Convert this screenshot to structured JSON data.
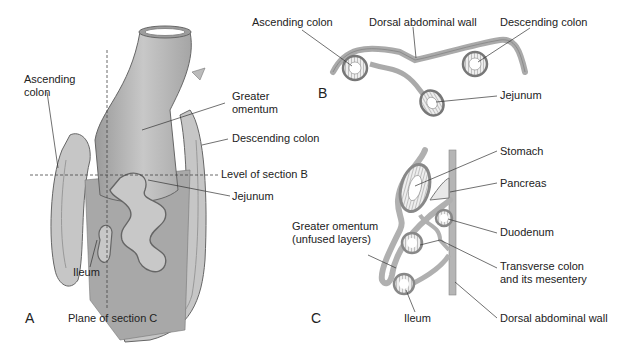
{
  "figure": {
    "panels": {
      "A": {
        "letter": "A",
        "labels": {
          "ascending_colon_1": "Ascending",
          "ascending_colon_2": "colon",
          "greater_omentum_1": "Greater",
          "greater_omentum_2": "omentum",
          "descending_colon": "Descending colon",
          "level_b": "Level of section B",
          "jejunum": "Jejunum",
          "ileum": "Ileum",
          "plane_c": "Plane of section C"
        }
      },
      "B": {
        "letter": "B",
        "labels": {
          "ascending_colon": "Ascending colon",
          "dorsal_wall": "Dorsal abdominal wall",
          "descending_colon": "Descending colon",
          "jejunum": "Jejunum"
        }
      },
      "C": {
        "letter": "C",
        "labels": {
          "stomach": "Stomach",
          "pancreas": "Pancreas",
          "greater_omentum_1": "Greater omentum",
          "greater_omentum_2": "(unfused layers)",
          "duodenum": "Duodenum",
          "transverse_1": "Transverse colon",
          "transverse_2": "and its mesentery",
          "ileum": "Ileum",
          "dorsal_wall": "Dorsal abdominal wall"
        }
      }
    },
    "colors": {
      "organ_fill": "#b8b8b8",
      "organ_light": "#d8d8d8",
      "organ_dark": "#8a8a8a",
      "outline": "#555555",
      "leader": "#333333"
    }
  }
}
